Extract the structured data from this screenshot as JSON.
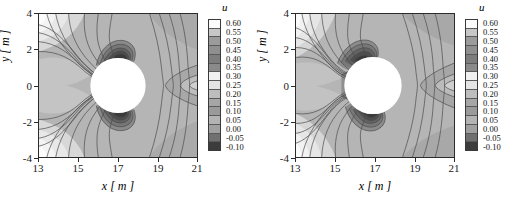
{
  "figure": {
    "type": "contour-pair",
    "background": "#ffffff"
  },
  "axes": {
    "xlabel_var": "x",
    "xlabel_unit": "[ m ]",
    "ylabel_var": "y",
    "ylabel_unit": "[ m ]",
    "xticks": [
      "13",
      "15",
      "17",
      "19",
      "21"
    ],
    "yticks": [
      "4",
      "2",
      "0",
      "-2",
      "-4"
    ],
    "frame_color": "#2b2b2b"
  },
  "colorbar": {
    "title": "u",
    "labels": [
      "0.60",
      "0.55",
      "0.50",
      "0.45",
      "0.40",
      "0.35",
      "0.30",
      "0.25",
      "0.20",
      "0.15",
      "0.10",
      "0.05",
      "0.00",
      "-0.05",
      "-0.10"
    ],
    "band_colors": [
      "#fbfbfb",
      "#c7c7c7",
      "#9b9b9b",
      "#8f8f8f",
      "#7d7d7d",
      "#8a8a8a",
      "#f0f0f0",
      "#e4e4e4",
      "#bdbdbd",
      "#a6a6a6",
      "#9a9a9a",
      "#b3b3b3",
      "#a0a0a0",
      "#707070",
      "#3c3c3c"
    ]
  },
  "panels": [
    {
      "id": "panel-left",
      "name": "contour-plot-left"
    },
    {
      "id": "panel-right",
      "name": "contour-plot-right"
    }
  ],
  "chart_data": {
    "type": "heatmap",
    "title": "",
    "subtitle": "",
    "xlabel": "x [ m ]",
    "ylabel": "y [ m ]",
    "xlim": [
      13,
      21
    ],
    "ylim": [
      -4,
      4
    ],
    "xticks": [
      13,
      15,
      17,
      19,
      21
    ],
    "yticks": [
      -4,
      -2,
      0,
      2,
      4
    ],
    "grid": false,
    "legend": "colorbar-right-of-each-panel",
    "colorbar_label": "u",
    "contour_levels": [
      -0.1,
      -0.05,
      0.0,
      0.05,
      0.1,
      0.15,
      0.2,
      0.25,
      0.3,
      0.35,
      0.4,
      0.45,
      0.5,
      0.55,
      0.6
    ],
    "colormap": "grayscale-banded",
    "zlim": [
      -0.1,
      0.6
    ],
    "masked_region": {
      "shape": "circle",
      "center_x": 17.0,
      "center_y": 0.0,
      "radius": 1.55,
      "fill": "#ffffff",
      "description": "cylinder cross-section excluded from the field"
    },
    "panels": [
      {
        "name": "left",
        "description": "Contour field of u around a circular cylinder. Two dark low-value lobes (u near -0.10 to 0.05) sit just above and just below the cylinder, centred near x=16.6, y=+2.2 and x=16.6, y=-2.2. Light high-value bands (u near 0.45-0.60) fan out toward the upper-left and lower-left corners. A mid-grey saddle (u near 0.25-0.30) lies downstream near x=20, y=0.",
        "hotspots": [
          {
            "x": 16.6,
            "y": 2.2,
            "u": -0.08
          },
          {
            "x": 16.6,
            "y": -2.2,
            "u": -0.08
          },
          {
            "x": 13.6,
            "y": 3.4,
            "u": 0.58
          },
          {
            "x": 13.6,
            "y": -3.4,
            "u": 0.58
          },
          {
            "x": 20.2,
            "y": 0.0,
            "u": 0.27
          },
          {
            "x": 14.8,
            "y": 0.0,
            "u": 0.12
          }
        ]
      },
      {
        "name": "right",
        "description": "Contour field of u around the same circular cylinder but with the low-value lobes rotated toward the upstream-left side. Dark lobes (u near -0.10 to 0.05) sit near x=15.6, y=+2.0 and x=16.4, y=-2.3, with a dark band hugging the left face of the cylinder. Light high-value bands (u near 0.45-0.60) occupy the far left edge and the upper-left corner. A mid-grey saddle (u near 0.25-0.30) lies near x=20.3, y=0.",
        "hotspots": [
          {
            "x": 15.6,
            "y": 2.0,
            "u": -0.06
          },
          {
            "x": 16.4,
            "y": -2.3,
            "u": -0.08
          },
          {
            "x": 13.3,
            "y": 2.6,
            "u": 0.56
          },
          {
            "x": 13.3,
            "y": -3.0,
            "u": 0.54
          },
          {
            "x": 20.3,
            "y": 0.0,
            "u": 0.28
          },
          {
            "x": 14.6,
            "y": 0.2,
            "u": 0.1
          }
        ]
      }
    ]
  }
}
